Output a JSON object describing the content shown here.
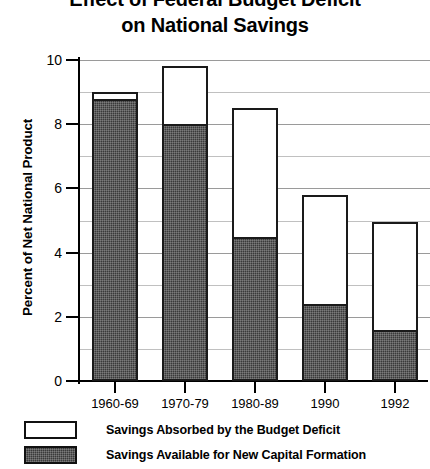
{
  "chart_data": {
    "type": "bar",
    "title": "Effect of Federal Budget Deficit on National Savings",
    "title_lines": [
      "Effect of Federal Budget Deficit",
      "on National Savings"
    ],
    "xlabel": "",
    "ylabel": "Percent of Net National Product",
    "categories": [
      "1960-69",
      "1970-79",
      "1980-89",
      "1990",
      "1992"
    ],
    "ylim": [
      0,
      10
    ],
    "yticks": [
      0,
      2,
      4,
      6,
      8,
      10
    ],
    "ytick_labels": [
      "0",
      "2",
      "4",
      "6",
      "8",
      "10"
    ],
    "minor_gridlines": [
      1,
      3,
      5,
      7,
      9
    ],
    "grid": true,
    "grid_orientation": "horizontal",
    "stacked": true,
    "legend_position": "bottom-left",
    "series": [
      {
        "name": "Savings Available for New Capital Formation",
        "color": "#3a3a3a",
        "fill": "dark-hatched",
        "values": [
          8.8,
          8.0,
          4.5,
          2.4,
          1.6
        ]
      },
      {
        "name": "Savings Absorbed by the Budget Deficit",
        "color": "#ffffff",
        "fill": "open",
        "values": [
          0.2,
          1.8,
          4.0,
          3.4,
          3.35
        ]
      }
    ],
    "totals": [
      9.0,
      9.8,
      8.5,
      5.8,
      4.95
    ]
  },
  "legend": {
    "items": [
      {
        "label": "Savings Absorbed by the Budget Deficit",
        "swatch": "open"
      },
      {
        "label": "Savings Available for New Capital Formation",
        "swatch": "filled"
      }
    ]
  }
}
